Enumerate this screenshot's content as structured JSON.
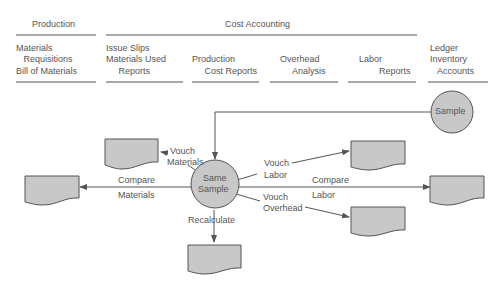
{
  "header": {
    "production": {
      "title": "Production",
      "columns": [
        {
          "lines": [
            "Materials",
            "   Requisitions",
            "Bill of Materials"
          ]
        }
      ]
    },
    "cost_accounting": {
      "title": "Cost Accounting",
      "columns": [
        {
          "lines": [
            "Issue Slips",
            "Materials Used",
            "     Reports"
          ]
        },
        {
          "lines": [
            "Production",
            "     Cost Reports"
          ]
        },
        {
          "lines": [
            "Overhead",
            "     Analysis"
          ]
        },
        {
          "lines": [
            "Labor",
            "        Reports"
          ]
        }
      ]
    },
    "ledger": {
      "lines": [
        "Ledger",
        "Inventory",
        "   Accounts"
      ]
    }
  },
  "nodes": {
    "sample": "Sample",
    "same_sample": [
      "Same",
      "Sample"
    ]
  },
  "edges": {
    "vouch_materials": [
      "Vouch",
      "Materials"
    ],
    "compare_materials": [
      "Compare",
      "Materials"
    ],
    "recalculate": "Recalculate",
    "vouch_labor": [
      "Vouch",
      "Labor"
    ],
    "compare_labor": [
      "Compare",
      "Labor"
    ],
    "vouch_overhead": [
      "Vouch",
      "Overhead"
    ]
  },
  "colors": {
    "line": "#555555",
    "fill": "#c8c8c8",
    "text": "#555555"
  }
}
